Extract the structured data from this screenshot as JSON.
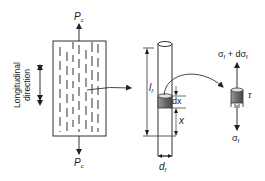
{
  "diagram": {
    "type": "fiber-reinforced composite load transfer",
    "composite_block": {
      "load_top": {
        "symbol": "P",
        "subscript": "c"
      },
      "load_bottom": {
        "symbol": "P",
        "subscript": "c"
      },
      "direction_label_line1": "Longitudinal",
      "direction_label_line2": "direction"
    },
    "single_fiber": {
      "length": {
        "symbol": "l",
        "subscript": "f"
      },
      "diameter": {
        "symbol": "d",
        "subscript": "f"
      },
      "element_thickness": "dx",
      "position": "x"
    },
    "element": {
      "stress_top": "σf + dσf",
      "stress_top_parts": {
        "sigma": "σ",
        "sub": "f",
        "plus": " + d",
        "sigma2": "σ",
        "sub2": "f"
      },
      "stress_bottom": {
        "sigma": "σ",
        "sub": "f"
      },
      "shear": "τ"
    },
    "colors": {
      "line": "#333333",
      "fiber_dash": "#555555",
      "element_fill": "#7a7a7a",
      "element_top": "#d8d8d8"
    }
  }
}
